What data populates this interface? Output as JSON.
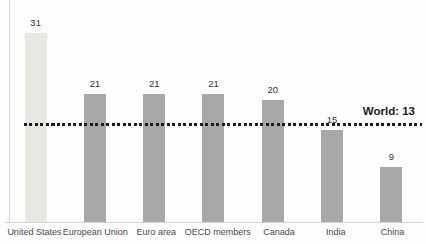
{
  "chart_data": {
    "type": "bar",
    "title": "",
    "xlabel": "",
    "ylabel": "",
    "categories": [
      "United States",
      "European Union",
      "Euro area",
      "OECD members",
      "Canada",
      "India",
      "China"
    ],
    "values": [
      31,
      21,
      21,
      21,
      20,
      15,
      9
    ],
    "data_labels": [
      "31",
      "21",
      "21",
      "21",
      "20",
      "15",
      "9"
    ],
    "reference_line": {
      "label": "World: 13",
      "value": 13
    },
    "ylim": [
      0,
      36
    ],
    "grid": false,
    "legend": "none",
    "highlighted_category": "United States",
    "colors": {
      "highlight_bar": "#e9e7e1",
      "bar": "#a8a8a8",
      "axis": "#d4d4d4",
      "reference_line": "#1c1c1c",
      "reference_label": "#1a1a1a",
      "value_label": "#333333",
      "category_label": "#4a4a4a",
      "background": "#fdfdfd"
    }
  }
}
